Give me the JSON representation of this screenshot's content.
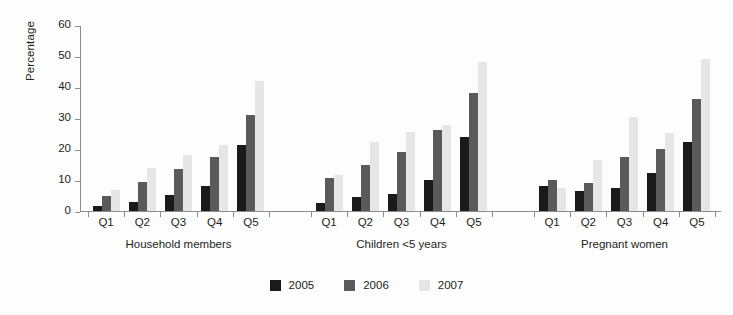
{
  "chart_data": {
    "type": "bar",
    "title": "",
    "subtitle": "",
    "xlabel": "",
    "ylabel": "Percentage",
    "ylim": [
      0,
      60
    ],
    "yticks": [
      0,
      10,
      20,
      30,
      40,
      50,
      60
    ],
    "grid": false,
    "legend_position": "bottom-center",
    "categories": [
      "Q1",
      "Q2",
      "Q3",
      "Q4",
      "Q5"
    ],
    "groups": [
      {
        "label": "Household members",
        "categories": [
          "Q1",
          "Q2",
          "Q3",
          "Q4",
          "Q5"
        ],
        "series": [
          {
            "name": "2005",
            "values": [
              1.5,
              3.0,
              5.2,
              8.1,
              21.3
            ]
          },
          {
            "name": "2006",
            "values": [
              5.0,
              9.2,
              13.4,
              17.5,
              31.1
            ]
          },
          {
            "name": "2007",
            "values": [
              6.8,
              13.9,
              18.1,
              21.2,
              42.0
            ]
          }
        ]
      },
      {
        "label": "Children <5 years",
        "categories": [
          "Q1",
          "Q2",
          "Q3",
          "Q4",
          "Q5"
        ],
        "series": [
          {
            "name": "2005",
            "values": [
              2.6,
              4.4,
              5.5,
              10.1,
              23.9
            ]
          },
          {
            "name": "2006",
            "values": [
              10.8,
              14.7,
              19.0,
              26.0,
              38.2
            ]
          },
          {
            "name": "2007",
            "values": [
              11.7,
              22.2,
              25.6,
              27.9,
              48.0
            ]
          }
        ]
      },
      {
        "label": "Pregnant women",
        "categories": [
          "Q1",
          "Q2",
          "Q3",
          "Q4",
          "Q5"
        ],
        "series": [
          {
            "name": "2005",
            "values": [
              8.0,
              6.5,
              7.4,
              12.4,
              22.2
            ]
          },
          {
            "name": "2006",
            "values": [
              10.0,
              9.1,
              17.3,
              20.0,
              36.2
            ]
          },
          {
            "name": "2007",
            "values": [
              7.4,
              16.6,
              30.3,
              25.2,
              49.0
            ]
          }
        ]
      }
    ],
    "series_colors": {
      "2005": "#1a1a1a",
      "2006": "#5a5a5a",
      "2007": "#e6e6e6"
    },
    "legend": [
      {
        "label": "2005",
        "color": "#1a1a1a"
      },
      {
        "label": "2006",
        "color": "#5a5a5a"
      },
      {
        "label": "2007",
        "color": "#e6e6e6"
      }
    ],
    "axis_color": "#8c8c8c",
    "background": "#fdfdfd"
  }
}
